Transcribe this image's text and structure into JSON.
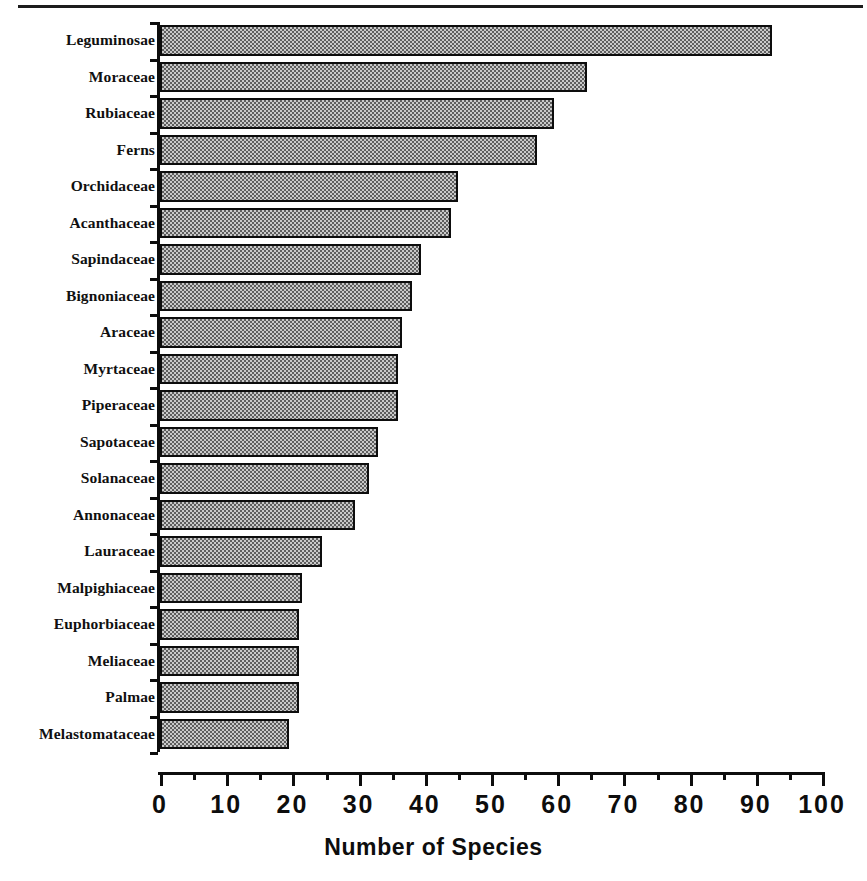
{
  "chart_data": {
    "type": "bar",
    "orientation": "horizontal",
    "title": "",
    "xlabel": "Number of Species",
    "ylabel": "",
    "xlim": [
      0,
      100
    ],
    "xticks": [
      0,
      10,
      20,
      30,
      40,
      50,
      60,
      70,
      80,
      90,
      100
    ],
    "xtick_labels": [
      "0",
      "10",
      "20",
      "30",
      "40",
      "50",
      "60",
      "70",
      "80",
      "90",
      "100"
    ],
    "minor_tick_interval": 5,
    "grid": false,
    "legend": null,
    "categories": [
      "Leguminosae",
      "Moraceae",
      "Rubiaceae",
      "Ferns",
      "Orchidaceae",
      "Acanthaceae",
      "Sapindaceae",
      "Bignoniaceae",
      "Araceae",
      "Myrtaceae",
      "Piperaceae",
      "Sapotaceae",
      "Solanaceae",
      "Annonaceae",
      "Lauraceae",
      "Malpighiaceae",
      "Euphorbiaceae",
      "Meliaceae",
      "Palmae",
      "Melastomataceae"
    ],
    "values": [
      92.5,
      64.5,
      59.5,
      57,
      45,
      44,
      39.5,
      38,
      36.5,
      36,
      36,
      33,
      31.5,
      29.5,
      24.5,
      21.5,
      21,
      21,
      21,
      19.5
    ],
    "bars": [
      {
        "label": "Leguminosae",
        "value": 92.5
      },
      {
        "label": "Moraceae",
        "value": 64.5
      },
      {
        "label": "Rubiaceae",
        "value": 59.5
      },
      {
        "label": "Ferns",
        "value": 57
      },
      {
        "label": "Orchidaceae",
        "value": 45
      },
      {
        "label": "Acanthaceae",
        "value": 44
      },
      {
        "label": "Sapindaceae",
        "value": 39.5
      },
      {
        "label": "Bignoniaceae",
        "value": 38
      },
      {
        "label": "Araceae",
        "value": 36.5
      },
      {
        "label": "Myrtaceae",
        "value": 36
      },
      {
        "label": "Piperaceae",
        "value": 36
      },
      {
        "label": "Sapotaceae",
        "value": 33
      },
      {
        "label": "Solanaceae",
        "value": 31.5
      },
      {
        "label": "Annonaceae",
        "value": 29.5
      },
      {
        "label": "Lauraceae",
        "value": 24.5
      },
      {
        "label": "Malpighiaceae",
        "value": 21.5
      },
      {
        "label": "Euphorbiaceae",
        "value": 21
      },
      {
        "label": "Meliaceae",
        "value": 21
      },
      {
        "label": "Palmae",
        "value": 21
      },
      {
        "label": "Melastomataceae",
        "value": 19.5
      }
    ],
    "style": {
      "bar_fill_color": "#9a9a9a",
      "bar_pattern": "checkerboard-dither",
      "bar_edge_color": "#0d0d0d",
      "axis_color": "#0d0d0d",
      "background_color": "#ffffff"
    }
  }
}
